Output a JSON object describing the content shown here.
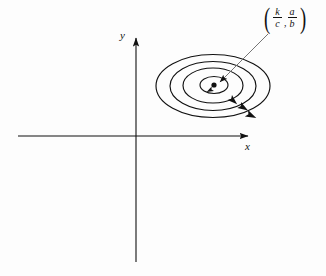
{
  "figure": {
    "background_color": "#fdfdfd",
    "stroke_color": "#111111"
  },
  "axes": {
    "x_label": "x",
    "y_label": "y",
    "origin": {
      "x": 136,
      "y": 136
    },
    "x_axis": {
      "x_start": 18,
      "x_end": 253,
      "y": 136,
      "arrow": "right"
    },
    "y_axis": {
      "x": 136,
      "y_start": 262,
      "y_end": 32,
      "arrow": "up"
    }
  },
  "equilibrium": {
    "label_text": "(k/c , a/b)",
    "open_paren": "(",
    "close_paren": ")",
    "separator": ",",
    "first_coordinate": {
      "numerator": "k",
      "denominator": "c"
    },
    "second_coordinate": {
      "numerator": "a",
      "denominator": "b"
    },
    "point": {
      "x": 216,
      "y": 85
    },
    "dot_radius": 2.6
  },
  "leader_line": {
    "from": {
      "x": 268,
      "y": 34
    },
    "to": {
      "x": 218,
      "y": 84
    },
    "arrow": "toward-point"
  },
  "orbits": {
    "direction": "clockwise",
    "count": 4,
    "center": {
      "x": 213,
      "y": 85.5
    },
    "ellipses": [
      {
        "name": "orbit-1-inner",
        "rx": 14,
        "ry": 8.5,
        "cx": 214,
        "cy": 85
      },
      {
        "name": "orbit-2",
        "rx": 30,
        "ry": 17.5,
        "cx": 213,
        "cy": 85.5
      },
      {
        "name": "orbit-3",
        "rx": 43,
        "ry": 24.5,
        "cx": 213,
        "cy": 86
      },
      {
        "name": "orbit-4-outer",
        "rx": 57,
        "ry": 31.5,
        "cx": 213,
        "cy": 86
      }
    ],
    "arrowheads": [
      {
        "name": "flow-arrow-inner",
        "x": 210,
        "y": 93.5,
        "angle": 195
      },
      {
        "name": "flow-arrow-2",
        "x": 240,
        "y": 99.5,
        "angle": 42
      },
      {
        "name": "flow-arrow-3",
        "x": 249,
        "y": 107,
        "angle": 32
      },
      {
        "name": "flow-arrow-4",
        "x": 256,
        "y": 114.5,
        "angle": 26
      }
    ]
  }
}
